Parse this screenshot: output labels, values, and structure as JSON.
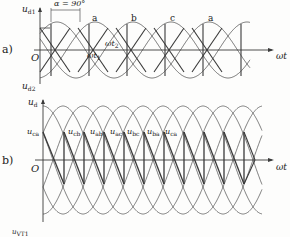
{
  "figure": {
    "panels": [
      {
        "tag": "a)",
        "y_axis_top_label": {
          "main": "u",
          "sub": "d1"
        },
        "y_axis_bottom_label": {
          "main": "u",
          "sub": "d2"
        },
        "origin_label": "O",
        "x_axis_label": "ωt",
        "angle_annotation": "α = 90°",
        "phase_labels": [
          "a",
          "b",
          "c",
          "a"
        ],
        "time_labels": [
          {
            "main": "ωt",
            "sub": "1"
          },
          {
            "main": "ωt",
            "sub": "2"
          }
        ]
      },
      {
        "tag": "b)",
        "y_axis_top_label": {
          "main": "u",
          "sub": "d"
        },
        "origin_label": "O",
        "x_axis_label": "ωt",
        "line_voltage_labels": [
          {
            "main": "u",
            "sub": "ca"
          },
          {
            "main": "u",
            "sub": "cb"
          },
          {
            "main": "u",
            "sub": "ab"
          },
          {
            "main": "u",
            "sub": "ac"
          },
          {
            "main": "u",
            "sub": "bc"
          },
          {
            "main": "u",
            "sub": "ba"
          },
          {
            "main": "u",
            "sub": "ca"
          }
        ]
      }
    ],
    "partial_label_bottom": {
      "main": "u",
      "sub": "VT1"
    }
  }
}
